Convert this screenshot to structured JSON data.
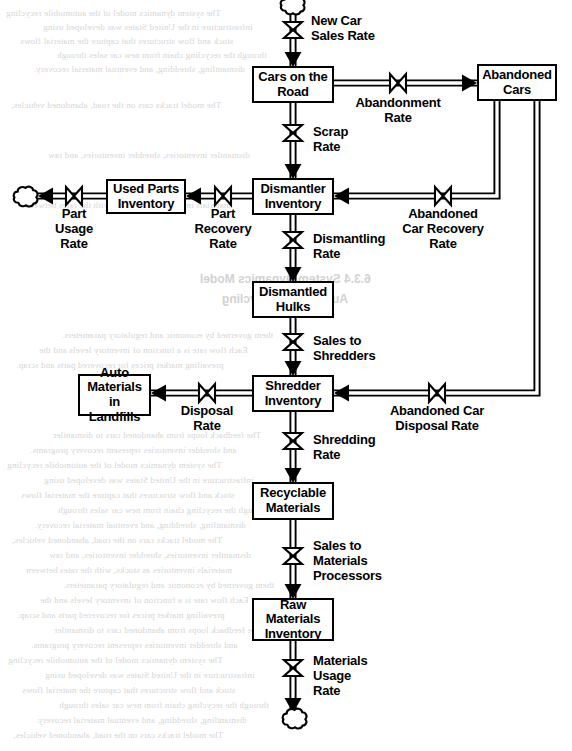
{
  "diagram": {
    "type": "stock-and-flow",
    "stroke_color": "#000000",
    "background_color": "#ffffff"
  },
  "stocks": [
    {
      "id": "cars_on_road",
      "label": "Cars on the\nRoad",
      "x": 252,
      "y": 66,
      "w": 82,
      "h": 37
    },
    {
      "id": "abandoned_cars",
      "label": "Abandoned\nCars",
      "x": 477,
      "y": 64,
      "w": 80,
      "h": 37
    },
    {
      "id": "used_parts_inv",
      "label": "Used Parts\nInventory",
      "x": 106,
      "y": 179,
      "w": 80,
      "h": 35
    },
    {
      "id": "dismantler_inv",
      "label": "Dismantler\nInventory",
      "x": 252,
      "y": 178,
      "w": 82,
      "h": 37
    },
    {
      "id": "dismantled_hulks",
      "label": "Dismantled\nHulks",
      "x": 252,
      "y": 281,
      "w": 82,
      "h": 37
    },
    {
      "id": "auto_mat_landfills",
      "label": "Auto\nMaterials in\nLandfills",
      "x": 78,
      "y": 374,
      "w": 73,
      "h": 42
    },
    {
      "id": "shredder_inv",
      "label": "Shredder\nInventory",
      "x": 252,
      "y": 375,
      "w": 82,
      "h": 37
    },
    {
      "id": "recyclable_mat",
      "label": "Recyclable\nMaterials",
      "x": 252,
      "y": 482,
      "w": 82,
      "h": 38
    },
    {
      "id": "raw_mat_inv",
      "label": "Raw\nMaterials\nInventory",
      "x": 252,
      "y": 598,
      "w": 82,
      "h": 43
    }
  ],
  "flows": [
    {
      "id": "new_car_sales_rate",
      "label": "New Car\nSales Rate",
      "valve_x": 293,
      "valve_y": 30,
      "label_x": 311,
      "label_y": 13,
      "align": "lft"
    },
    {
      "id": "abandonment_rate",
      "label": "Abandonment\nRate",
      "valve_x": 398,
      "valve_y": 83,
      "label_x": 398,
      "label_y": 95,
      "align": "ctr"
    },
    {
      "id": "scrap_rate",
      "label": "Scrap\nRate",
      "valve_x": 293,
      "valve_y": 133,
      "label_x": 313,
      "label_y": 124,
      "align": "lft"
    },
    {
      "id": "part_usage_rate",
      "label": "Part\nUsage\nRate",
      "valve_x": 74,
      "valve_y": 196,
      "label_x": 74,
      "label_y": 206,
      "align": "ctr"
    },
    {
      "id": "part_recovery_rate",
      "label": "Part\nRecovery\nRate",
      "valve_x": 223,
      "valve_y": 196,
      "label_x": 223,
      "label_y": 206,
      "align": "ctr"
    },
    {
      "id": "abandoned_car_recovery_rate",
      "label": "Abandoned\nCar Recovery\nRate",
      "valve_x": 443,
      "valve_y": 196,
      "label_x": 443,
      "label_y": 206,
      "align": "ctr"
    },
    {
      "id": "dismantling_rate",
      "label": "Dismantling\nRate",
      "valve_x": 293,
      "valve_y": 240,
      "label_x": 313,
      "label_y": 231,
      "align": "lft"
    },
    {
      "id": "sales_to_shredders",
      "label": "Sales to\nShredders",
      "valve_x": 293,
      "valve_y": 342,
      "label_x": 313,
      "label_y": 333,
      "align": "lft"
    },
    {
      "id": "disposal_rate",
      "label": "Disposal\nRate",
      "valve_x": 207,
      "valve_y": 393,
      "label_x": 207,
      "label_y": 403,
      "align": "ctr"
    },
    {
      "id": "abandoned_car_disposal_rate",
      "label": "Abandoned Car\nDisposal Rate",
      "valve_x": 437,
      "valve_y": 393,
      "label_x": 437,
      "label_y": 403,
      "align": "ctr"
    },
    {
      "id": "shredding_rate",
      "label": "Shredding\nRate",
      "valve_x": 293,
      "valve_y": 441,
      "label_x": 313,
      "label_y": 432,
      "align": "lft"
    },
    {
      "id": "sales_to_mat_processors",
      "label": "Sales to\nMaterials\nProcessors",
      "valve_x": 293,
      "valve_y": 556,
      "label_x": 313,
      "label_y": 538,
      "align": "lft"
    },
    {
      "id": "materials_usage_rate",
      "label": "Materials\nUsage\nRate",
      "valve_x": 293,
      "valve_y": 668,
      "label_x": 313,
      "label_y": 653,
      "align": "lft"
    }
  ],
  "clouds": [
    {
      "id": "source_new_cars",
      "x": 293,
      "y": 4
    },
    {
      "id": "sink_part_usage",
      "x": 26,
      "y": 196
    },
    {
      "id": "sink_materials_usage",
      "x": 295,
      "y": 718
    }
  ],
  "ghost_text": {
    "headings": [
      {
        "text": "6.3.4  System Dynamics Model",
        "x": 200,
        "y": 272
      },
      {
        "text": "Automobile Recycling",
        "x": 222,
        "y": 292
      }
    ],
    "lines": [
      "The system dynamics model of the automobile recycling",
      "infrastructure in the United States was developed using",
      "stock and flow structures that capture the material flows",
      "through the recycling chain from new car sales through",
      "dismantling, shredding, and eventual material recovery.",
      "The model tracks cars on the road, abandoned vehicles,",
      "dismantler inventories, shredder inventories, and raw",
      "materials inventories as stocks, with the rates between",
      "them governed by economic and regulatory parameters.",
      "Each flow rate is a function of inventory levels and the",
      "prevailing market prices for recovered parts and scrap.",
      "The feedback loops from abandoned cars to dismantler",
      "and shredder inventories represent recovery programs."
    ]
  }
}
